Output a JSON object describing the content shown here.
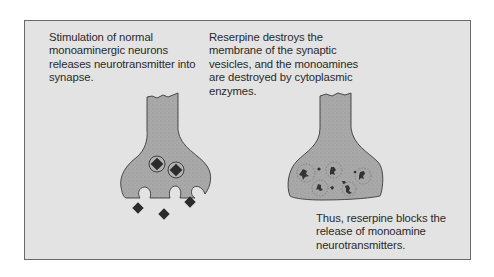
{
  "colors": {
    "background": "#e3e3e3",
    "border": "#6a6a6a",
    "neuron_fill": "#a9a9a9",
    "neuron_stroke": "#3a3a3a",
    "transmitter": "#2b2b2b",
    "text": "#2a2a2a"
  },
  "captions": {
    "normal": "Stimulation of normal monoaminergic neurons releases neurotransmitter into synapse.",
    "reserpine_action": "Reserpine destroys the membrane of the synaptic vesicles, and the monoamines are destroyed by cytoplasmic enzymes.",
    "conclusion": "Thus, reserpine blocks the release of monoamine neurotransmitters."
  },
  "panels": [
    {
      "name": "normal-neuron",
      "vesicles": 2,
      "released_transmitters": 3
    },
    {
      "name": "reserpine-treated-neuron",
      "vesicles": 5,
      "state": "destroyed"
    }
  ]
}
